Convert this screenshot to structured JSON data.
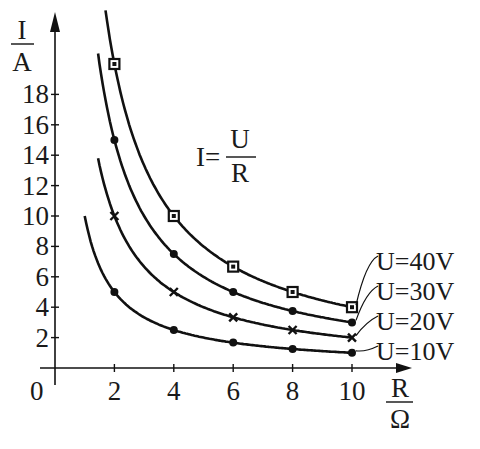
{
  "chart_data": {
    "type": "line",
    "title": "",
    "formula": {
      "lhs": "I=",
      "numerator": "U",
      "denominator": "R"
    },
    "xlabel": {
      "numerator": "R",
      "denominator": "Ω"
    },
    "ylabel": {
      "numerator": "I",
      "denominator": "A"
    },
    "origin_label": "0",
    "xlim": [
      0,
      11.5
    ],
    "ylim": [
      0,
      20
    ],
    "x_ticks": [
      2,
      4,
      6,
      8,
      10
    ],
    "y_ticks": [
      2,
      4,
      6,
      8,
      10,
      12,
      14,
      16,
      18
    ],
    "grid": false,
    "legend_position": "right, labels attached to curve ends",
    "x": [
      2,
      4,
      6,
      8,
      10
    ],
    "series": [
      {
        "name": "U=40V",
        "U": 40,
        "marker": "square",
        "values": [
          20,
          10,
          6.67,
          5,
          4
        ],
        "curve_start_R": 1.7
      },
      {
        "name": "U=30V",
        "U": 30,
        "marker": "dot",
        "values": [
          15,
          7.5,
          5,
          3.75,
          3
        ],
        "curve_start_R": 1.45
      },
      {
        "name": "U=20V",
        "U": 20,
        "marker": "cross",
        "values": [
          10,
          5,
          3.33,
          2.5,
          2
        ],
        "curve_start_R": 1.45
      },
      {
        "name": "U=10V",
        "U": 10,
        "marker": "dot",
        "values": [
          5,
          2.5,
          1.67,
          1.25,
          1
        ],
        "curve_start_R": 1.0
      }
    ]
  }
}
